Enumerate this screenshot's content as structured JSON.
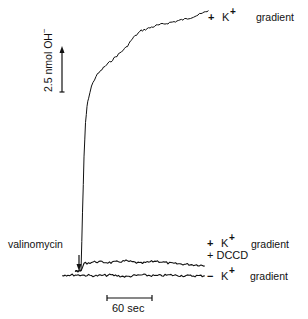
{
  "chart_data": {
    "type": "line",
    "title": "",
    "xlabel": "",
    "ylabel": "",
    "x_units": "sec",
    "y_units": "nmol OH-",
    "y_scale_bar": {
      "value": 2.5,
      "label": "2.5 nmol OH",
      "superscript": "−"
    },
    "x_scale_bar": {
      "value": 60,
      "label": "60 sec"
    },
    "annotations": [
      {
        "text": "valinomycin",
        "type": "arrow",
        "at_time_sec": 0
      }
    ],
    "series": [
      {
        "name": "+ K+ gradient",
        "label_sign": "+",
        "label_ion": "K",
        "label_sup": "+",
        "label_word": "gradient",
        "t_sec": [
          -8,
          0,
          2,
          4,
          6,
          8,
          10,
          14,
          20,
          30,
          40,
          50,
          60,
          70,
          80,
          100,
          120,
          140,
          160,
          170
        ],
        "nmol": [
          0.0,
          0.0,
          3.5,
          6.8,
          8.8,
          9.8,
          10.3,
          11.0,
          11.6,
          12.1,
          12.5,
          12.9,
          13.3,
          13.9,
          14.3,
          14.6,
          14.8,
          15.0,
          15.3,
          15.5
        ]
      },
      {
        "name": "+ K+ gradient + DCCD",
        "label_line1_sign": "+",
        "label_line1_ion": "K",
        "label_line1_sup": "+",
        "label_line1_word": "gradient",
        "label_line2": "+ DCCD",
        "t_sec": [
          -8,
          0,
          4,
          20,
          40,
          60,
          80,
          100,
          120,
          140,
          160,
          165
        ],
        "nmol": [
          0.0,
          0.0,
          0.45,
          0.55,
          0.5,
          0.6,
          0.45,
          0.6,
          0.45,
          0.4,
          0.35,
          0.3
        ]
      },
      {
        "name": "- K+ gradient",
        "label_sign": "−",
        "label_ion": "K",
        "label_sup": "+",
        "label_word": "gradient",
        "t_sec": [
          -25,
          0,
          20,
          40,
          60,
          80,
          100,
          120,
          140,
          160,
          165
        ],
        "nmol": [
          0.0,
          0.0,
          -0.05,
          0.0,
          -0.1,
          0.0,
          -0.05,
          0.0,
          -0.05,
          -0.05,
          -0.05
        ]
      }
    ]
  }
}
